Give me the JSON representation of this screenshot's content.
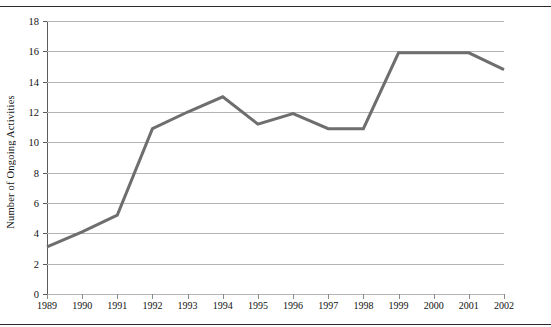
{
  "figure": {
    "top_remnant_text": "Figure 3.  Number of ongoing activities, 1989–2002",
    "caption_rule": "horizontal-rule"
  },
  "chart_data": {
    "type": "line",
    "title": "",
    "subtitle": "",
    "xlabel": "",
    "ylabel": "Number of Ongoing Activities",
    "x": [
      1989,
      1990,
      1991,
      1992,
      1993,
      1994,
      1995,
      1996,
      1997,
      1998,
      1999,
      2000,
      2001,
      2002
    ],
    "categories": [
      "1989",
      "1990",
      "1991",
      "1992",
      "1993",
      "1994",
      "1995",
      "1996",
      "1997",
      "1998",
      "1999",
      "2000",
      "2001",
      "2002"
    ],
    "values": [
      3.1,
      4.1,
      5.2,
      10.9,
      12.0,
      13.0,
      11.2,
      11.9,
      10.9,
      10.9,
      15.9,
      15.9,
      15.9,
      14.8
    ],
    "series": [
      {
        "name": "Number of Ongoing Activities",
        "values": [
          3.1,
          4.1,
          5.2,
          10.9,
          12.0,
          13.0,
          11.2,
          11.9,
          10.9,
          10.9,
          15.9,
          15.9,
          15.9,
          14.8
        ],
        "color": "#6e6e6e"
      }
    ],
    "ylim": [
      0,
      18
    ],
    "yticks": [
      0,
      2,
      4,
      6,
      8,
      10,
      12,
      14,
      16,
      18
    ],
    "ytick_labels": [
      "0",
      "2",
      "4",
      "6",
      "8",
      "10",
      "12",
      "14",
      "16",
      "18"
    ],
    "xtick_labels": [
      "1989",
      "1990",
      "1991",
      "1992",
      "1993",
      "1994",
      "1995",
      "1996",
      "1997",
      "1998",
      "1999",
      "2000",
      "2001",
      "2002"
    ],
    "grid": "horizontal",
    "legend": "none",
    "line_color": "#6e6e6e",
    "line_width": 3,
    "grid_color": "#b4b4b4",
    "axis_color": "#5a5a5a",
    "background": "#ffffff",
    "markers": "none"
  }
}
